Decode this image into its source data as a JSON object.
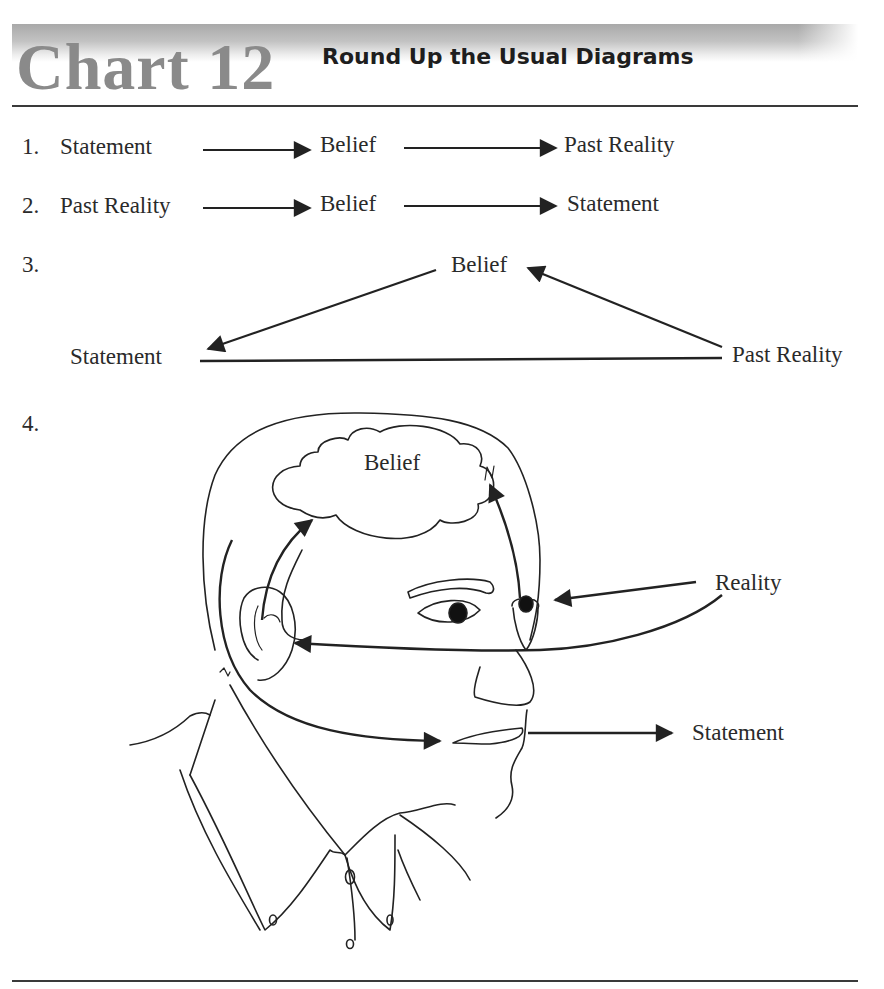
{
  "header": {
    "chart_number": "Chart 12",
    "title": "Round Up the Usual Diagrams"
  },
  "diagrams": [
    {
      "number": "1.",
      "type": "linear-flow",
      "nodes": [
        "Statement",
        "Belief",
        "Past Reality"
      ],
      "edges": [
        {
          "from": "Statement",
          "to": "Belief"
        },
        {
          "from": "Belief",
          "to": "Past Reality"
        }
      ]
    },
    {
      "number": "2.",
      "type": "linear-flow",
      "nodes": [
        "Past Reality",
        "Belief",
        "Statement"
      ],
      "edges": [
        {
          "from": "Past Reality",
          "to": "Belief"
        },
        {
          "from": "Belief",
          "to": "Statement"
        }
      ]
    },
    {
      "number": "3.",
      "type": "triangle-cycle",
      "nodes": [
        "Belief",
        "Statement",
        "Past Reality"
      ],
      "edges": [
        {
          "from": "Belief",
          "to": "Statement",
          "arrow": true
        },
        {
          "from": "Past Reality",
          "to": "Belief",
          "arrow": true
        },
        {
          "from": "Statement",
          "to": "Past Reality",
          "arrow": false
        }
      ]
    },
    {
      "number": "4.",
      "type": "head-illustration",
      "labels": {
        "cloud": "Belief",
        "reality": "Reality",
        "statement": "Statement"
      },
      "edges": [
        {
          "from": "Reality",
          "to": "Eye"
        },
        {
          "from": "Eye",
          "to": "Belief"
        },
        {
          "from": "Reality",
          "to": "Ear"
        },
        {
          "from": "Ear",
          "to": "Belief"
        },
        {
          "from": "Belief",
          "to": "Mouth"
        },
        {
          "from": "Mouth",
          "to": "Statement"
        }
      ]
    }
  ]
}
